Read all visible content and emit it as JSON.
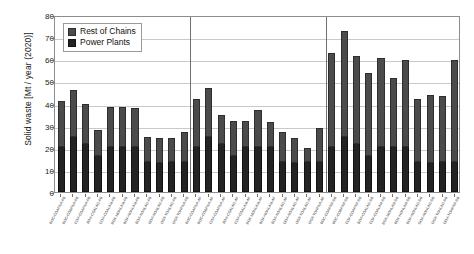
{
  "chart_data": {
    "type": "bar",
    "subtype": "stacked-bar",
    "title": "",
    "xlabel": "",
    "ylabel": "Solid waste [Mt / year (2020)]",
    "ylim": [
      0,
      80
    ],
    "ytick_step": 10,
    "yticks": [
      "0",
      "10",
      "20",
      "30",
      "40",
      "50",
      "60",
      "70",
      "80"
    ],
    "grid": "horizontal",
    "legend_position": "upper-left-inside",
    "group_dividers": [
      11,
      22
    ],
    "legend": [
      "Rest of Chains",
      "Power Plants"
    ],
    "series": [
      {
        "name": "Power Plants",
        "color": "#232323",
        "values": [
          20.5,
          25.0,
          21.5,
          16.5,
          20.5,
          20.5,
          20.5,
          13.5,
          13.0,
          13.5,
          13.5,
          20.5,
          25.0,
          21.5,
          16.5,
          20.5,
          20.5,
          20.5,
          13.5,
          13.0,
          13.5,
          13.5,
          20.5,
          25.0,
          21.5,
          16.5,
          20.5,
          20.5,
          20.5,
          13.5,
          13.0,
          13.5,
          13.5
        ]
      },
      {
        "name": "Rest of Chains",
        "color": "#4b4b4b",
        "values": [
          20.5,
          21.3,
          18.5,
          11.5,
          18.0,
          17.8,
          17.3,
          11.5,
          11.5,
          11.0,
          13.5,
          21.5,
          22.0,
          13.5,
          15.5,
          11.5,
          16.5,
          11.0,
          13.5,
          11.5,
          6.5,
          15.5,
          42.5,
          48.0,
          40.0,
          37.5,
          40.0,
          31.0,
          39.0,
          28.5,
          31.0,
          30.0,
          46.0
        ]
      }
    ],
    "totals": [
      41.0,
      46.3,
      40.0,
      28.0,
      38.5,
      38.3,
      37.8,
      25.0,
      24.5,
      24.5,
      27.0,
      41.0,
      47.0,
      35.0,
      32.0,
      32.0,
      37.0,
      31.5,
      27.0,
      24.5,
      20.0,
      29.0,
      63.0,
      73.0,
      61.5,
      54.0,
      60.5,
      51.5,
      59.5,
      42.0,
      44.0,
      43.5,
      59.5
    ],
    "categories": [
      "BOC-COAPNA-FB",
      "BOC-COBPNA-FB",
      "COX-COAPNA-FB",
      "BOX-COALAG-FB",
      "COX-COALAM-FB",
      "BOX-MONLAM-FB",
      "BOX-NONLAM-FB",
      "BOX-NONLAG-FB",
      "OOX-NONLAG-FB",
      "OOX-TONLAG-FB",
      "OOX-TOHPNA-FB",
      "BOC-COAPNA-AF",
      "BOC-COBPNA-AF",
      "COX-COAPNA-AF",
      "BOX-COALAG-AF",
      "COX-COALAM-AF",
      "BOX-MONLAM-AF",
      "BOX-NONLAM-AF",
      "BOX-NONLAG-AF",
      "OOX-NONLAG-AF",
      "OOX-TONLAG-AF",
      "OOX-TOHPNA-AF",
      "BOC-COAPNA-SB",
      "BOC-COBPNA-SB",
      "COX-COAPNA-SB",
      "BOX-COALAG-SB",
      "COX-COALAM-SB",
      "BOX-MONLAM-SB",
      "BOX-NONLAM-SB",
      "BOX-NONLAG-SB",
      "OOX-NONLAG-SB",
      "OOX-TONLAG-SB",
      "OOX-TOHPNA-SB"
    ]
  }
}
